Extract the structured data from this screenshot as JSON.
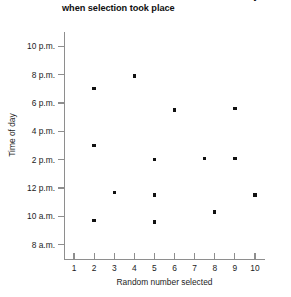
{
  "chart_data": {
    "type": "scatter",
    "title_visible": "between number selected and the time of day\nwhen selection took place",
    "xlabel": "Random number selected",
    "ylabel": "Time of day",
    "xlim": [
      0.5,
      10.5
    ],
    "ylim": [
      7,
      23
    ],
    "grid": false,
    "legend": null,
    "x_ticks": [
      1,
      2,
      3,
      4,
      5,
      6,
      7,
      8,
      9,
      10
    ],
    "x_tick_labels": [
      "1",
      "2",
      "3",
      "4",
      "5",
      "6",
      "7",
      "8",
      "9",
      "10"
    ],
    "y_ticks": [
      8,
      10,
      12,
      14,
      16,
      18,
      20,
      22
    ],
    "y_tick_labels": [
      "8 a.m.",
      "10 a.m.",
      "12 p.m.",
      "2 p.m.",
      "4 p.m.",
      "6 p.m.",
      "8 p.m.",
      "10 p.m."
    ],
    "marker": "square",
    "marker_color": "#111111",
    "points": [
      {
        "x": 2,
        "y": 19,
        "y_label": "7 p.m."
      },
      {
        "x": 2,
        "y": 15,
        "y_label": "3 p.m."
      },
      {
        "x": 2,
        "y": 9.7,
        "y_label": "9:40 a.m."
      },
      {
        "x": 3,
        "y": 11.7,
        "y_label": "11:40 a.m."
      },
      {
        "x": 4,
        "y": 19.9,
        "y_label": "7:55 p.m."
      },
      {
        "x": 5,
        "y": 14,
        "y_label": "2 p.m."
      },
      {
        "x": 5,
        "y": 11.5,
        "y_label": "11:30 a.m."
      },
      {
        "x": 5,
        "y": 9.6,
        "y_label": "9:35 a.m."
      },
      {
        "x": 6,
        "y": 17.5,
        "y_label": "5:30 p.m."
      },
      {
        "x": 7.5,
        "y": 14.1,
        "y_label": "2:05 p.m."
      },
      {
        "x": 8,
        "y": 10.3,
        "y_label": "10:20 a.m."
      },
      {
        "x": 9,
        "y": 17.6,
        "y_label": "5:35 p.m."
      },
      {
        "x": 9,
        "y": 14.1,
        "y_label": "2:05 p.m."
      },
      {
        "x": 10,
        "y": 11.5,
        "y_label": "11:30 a.m."
      }
    ]
  },
  "axes": {
    "y_title": "Time of day",
    "x_title": "Random number selected"
  }
}
